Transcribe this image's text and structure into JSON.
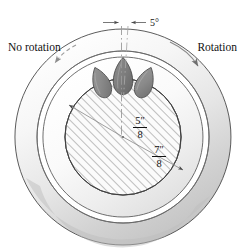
{
  "figure": {
    "type": "engineering-cross-section",
    "labels": {
      "no_rotation": "No rotation",
      "rotation": "Rotation",
      "angle": "5°"
    },
    "dimensions": [
      {
        "id": "inner-radius",
        "numerator": "5″",
        "denominator": "8",
        "value": 0.625,
        "unit": "in"
      },
      {
        "id": "outer-radius",
        "numerator": "7″",
        "denominator": "8",
        "value": 0.875,
        "unit": "in"
      }
    ],
    "colors": {
      "outline": "#3a3a3a",
      "roller_fill": "#8e8e8e",
      "roller_fill_dark": "#7a7a7a",
      "ring_light": "#fcfcfc",
      "ring_mid": "#e8e8e8",
      "ring_shade": "#c9c9c9",
      "hatch": "#808080",
      "text": "#111111",
      "dimension_line": "#8a8a8a"
    },
    "rollers": [
      {
        "id": "roller-left",
        "angle": -22
      },
      {
        "id": "roller-center",
        "angle": 0
      },
      {
        "id": "roller-right",
        "angle": 22
      }
    ],
    "geometry": {
      "center_x": 123,
      "center_y": 137,
      "outer_radius": 108,
      "ring_inner_radius": 86,
      "middle_circle_radius": 80,
      "hatched_radius": 58
    }
  }
}
